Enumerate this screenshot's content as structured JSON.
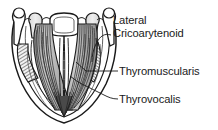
{
  "figure": {
    "kind": "anatomical-line-drawing",
    "orientation": "superior view, anterior at bottom",
    "style": "black-and-white pen-and-ink hatched illustration",
    "background_color": "#ffffff",
    "ink_color": "#1a1a1a",
    "shading_color": "#808080"
  },
  "labels": {
    "lateral_cricoarytenoid": {
      "line1": "Lateral",
      "line2": "Cricoarytenoid"
    },
    "thyromuscularis": {
      "text": "Thyromuscularis"
    },
    "thyrovocalis": {
      "text": "Thyrovocalis"
    }
  },
  "leaders": {
    "lateral_cricoarytenoid": "curved leader from label left edge to right lateral cricoarytenoid muscle",
    "thyromuscularis": "straight diagonal leader from label to lateral muscle belly",
    "thyrovocalis": "straight diagonal leader from label to medial vocalis fibers"
  }
}
